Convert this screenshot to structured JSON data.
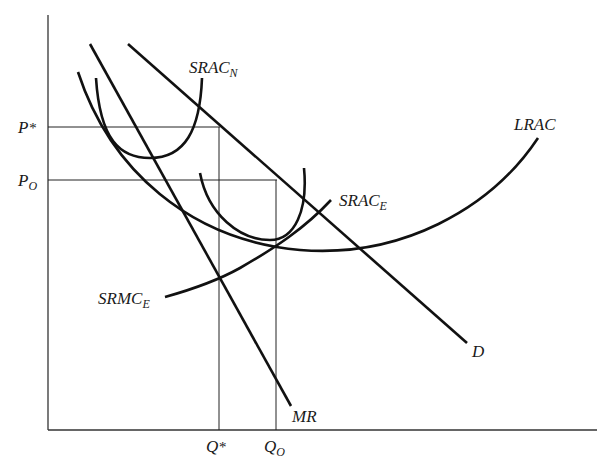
{
  "diagram": {
    "type": "economics-cost-curves",
    "axes": {
      "x_ticks": [
        {
          "main": "Q",
          "sup": "*",
          "sub": ""
        },
        {
          "main": "Q",
          "sup": "",
          "sub": "O"
        }
      ],
      "y_ticks": [
        {
          "main": "P",
          "sup": "*",
          "sub": ""
        },
        {
          "main": "P",
          "sup": "",
          "sub": "O"
        }
      ]
    },
    "curves": {
      "srac_n": {
        "main": "SRAC",
        "sub": "N"
      },
      "lrac": {
        "main": "LRAC",
        "sub": ""
      },
      "srac_e": {
        "main": "SRAC",
        "sub": "E"
      },
      "srmc_e": {
        "main": "SRMC",
        "sub": "E"
      },
      "demand": {
        "main": "D",
        "sub": ""
      },
      "mr": {
        "main": "MR",
        "sub": ""
      }
    },
    "line_color": "#111111",
    "background": "#ffffff"
  }
}
